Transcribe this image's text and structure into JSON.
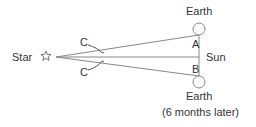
{
  "diagram": {
    "labels": {
      "star": "Star",
      "earth_top": "Earth",
      "earth_bottom": "Earth",
      "earth_bottom_note": "(6 months later)",
      "sun": "Sun",
      "angle_a": "A",
      "angle_b": "B",
      "angle_c_top": "C",
      "angle_c_bottom": "C"
    },
    "icons": {
      "star": "star-outline-icon"
    },
    "colors": {
      "line": "#888888",
      "text": "#333333"
    }
  }
}
